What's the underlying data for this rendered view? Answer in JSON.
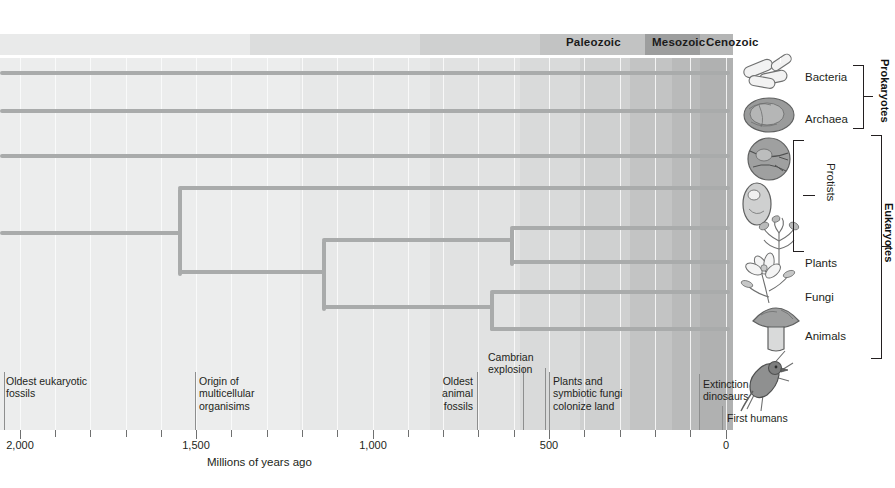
{
  "chart_data": {
    "type": "diagram-phylogenetic-tree",
    "title": "",
    "xlabel": "Millions of years ago",
    "xlim": [
      2000,
      0
    ],
    "x_ticks_major": [
      2000,
      1500,
      1000,
      500,
      0
    ],
    "x_ticks_minor": [
      1900,
      1800,
      1700,
      1600,
      1400,
      1300,
      1200,
      1100,
      900,
      800,
      700,
      600,
      400,
      300,
      200,
      100
    ],
    "grid": true,
    "eras": [
      {
        "name": "Paleozoic",
        "start_mya": 542,
        "end_mya": 251
      },
      {
        "name": "Mesozoic",
        "start_mya": 251,
        "end_mya": 65
      },
      {
        "name": "Cenozoic",
        "start_mya": 65,
        "end_mya": 0
      }
    ],
    "tips": [
      {
        "label": "Bacteria",
        "group": "Prokaryotes"
      },
      {
        "label": "Archaea",
        "group": "Prokaryotes"
      },
      {
        "label": "Protists",
        "group": "Eukaryotes"
      },
      {
        "label": "Plants",
        "group": "Eukaryotes"
      },
      {
        "label": "Fungi",
        "group": "Eukaryotes"
      },
      {
        "label": "Animals",
        "group": "Eukaryotes"
      }
    ],
    "events": [
      {
        "label": "Oldest eukaryotic fossils",
        "mya": 2100
      },
      {
        "label": "Origin of multicellular organisims",
        "mya": 1500
      },
      {
        "label": "Oldest animal fossils",
        "mya": 600
      },
      {
        "label": "Cambrian explosion",
        "mya": 542
      },
      {
        "label": "Plants and symbiotic fungi colonize land",
        "mya": 475
      },
      {
        "label": "Extinction of dinosaurs",
        "mya": 65
      },
      {
        "label": "First humans",
        "mya": 5
      }
    ]
  },
  "eras": [
    {
      "name": "Paleozoic",
      "left": 566
    },
    {
      "name": "Mesozoic",
      "left": 652
    },
    {
      "name": "Cenozoic",
      "left": 706
    }
  ],
  "axis": {
    "title": "Millions of years ago",
    "labels": [
      {
        "text": "2,000",
        "x": 20
      },
      {
        "text": "1,500",
        "x": 196
      },
      {
        "text": "1,000",
        "x": 373
      },
      {
        "text": "500",
        "x": 549
      },
      {
        "text": "0",
        "x": 726
      }
    ]
  },
  "annotations": [
    {
      "text": "Oldest eukaryotic\nfossils",
      "x": 6,
      "y": 375,
      "align": "left"
    },
    {
      "text": "Origin of\nmulticellular\norganisims",
      "x": 197,
      "y": 375,
      "align": "left"
    },
    {
      "text": "Oldest\nanimal\nfossils",
      "x": 472,
      "y": 375,
      "align": "right"
    },
    {
      "text": "Cambrian\nexplosion",
      "x": 488,
      "y": 351,
      "align": "left"
    },
    {
      "text": "Plants and\nsymbiotic fungi\ncolonize land",
      "x": 553,
      "y": 375,
      "align": "left"
    },
    {
      "text": "Extinction of\ndinosaurs",
      "x": 702,
      "y": 378,
      "align": "left"
    },
    {
      "text": "First humans",
      "x": 725,
      "y": 412,
      "align": "left"
    }
  ],
  "taxa": [
    {
      "label": "Bacteria",
      "icon": "bacteria-rods-icon",
      "y": 70
    },
    {
      "label": "Archaea",
      "icon": "archaea-cell-icon",
      "y": 113
    },
    {
      "label": "Protists",
      "icon": "protist-cluster-icon",
      "y": 196
    },
    {
      "label": "Plants",
      "icon": "flowering-plant-icon",
      "y": 257
    },
    {
      "label": "Fungi",
      "icon": "mushroom-icon",
      "y": 291
    },
    {
      "label": "Animals",
      "icon": "bird-icon",
      "y": 330
    }
  ],
  "groups": [
    {
      "label": "Prokaryotes"
    },
    {
      "label": "Eukaryotes"
    }
  ],
  "colors": {
    "branch": "#a9abab",
    "text": "#231f20",
    "era_mesozoic": "#9d9e9e",
    "plot_light": "#eceded",
    "plot_dark": "#b0b1b1"
  }
}
